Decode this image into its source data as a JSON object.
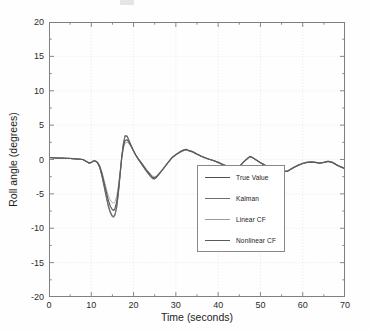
{
  "figure": {
    "type": "line-chart",
    "background": "#ffffff",
    "axes_color": "#808080"
  },
  "axis": {
    "xlabel": "Time (seconds)",
    "ylabel": "Roll angle (degrees)",
    "xticks": [
      0,
      10,
      20,
      30,
      40,
      50,
      60,
      70
    ],
    "yticks": [
      20,
      15,
      10,
      5,
      0,
      -5,
      -10,
      -15,
      -20
    ],
    "xlim": [
      0,
      70
    ],
    "ylim": [
      -20,
      20
    ]
  },
  "legend": {
    "position": "lower-right-inside",
    "entries": [
      {
        "label": "True Value",
        "color": "#4f4f4f",
        "width": 0.8
      },
      {
        "label": "Kalman",
        "color": "#6e6e6e",
        "width": 1.1
      },
      {
        "label": "Linear CF",
        "color": "#9a9a9a",
        "width": 0.8
      },
      {
        "label": "Nonlinear CF",
        "color": "#5a5a5a",
        "width": 1.2
      }
    ]
  },
  "chart_data": {
    "type": "line",
    "title": "",
    "xlabel": "Time (seconds)",
    "ylabel": "Roll angle (degrees)",
    "xlim": [
      0,
      70
    ],
    "ylim": [
      -20,
      20
    ],
    "xticks": [
      0,
      10,
      20,
      30,
      40,
      50,
      60,
      70
    ],
    "yticks": [
      20,
      15,
      10,
      5,
      0,
      -5,
      -10,
      -15,
      -20
    ],
    "grid": "dotted-major",
    "legend_position": "lower right",
    "x": [
      0,
      1,
      2,
      3,
      4,
      5,
      6,
      7,
      8,
      9,
      9.5,
      10,
      10.5,
      11,
      11.5,
      12,
      12.5,
      13,
      13.5,
      14,
      14.5,
      15,
      15.3,
      15.6,
      16,
      16.4,
      16.8,
      17.2,
      17.6,
      18,
      18.5,
      19,
      19.5,
      20,
      20.5,
      21,
      22,
      23,
      24,
      24.5,
      25,
      25.5,
      26,
      27,
      28,
      29,
      30,
      31,
      32,
      32.5,
      33,
      34,
      35,
      36,
      37,
      38,
      39,
      40,
      41,
      42,
      43,
      44,
      44.5,
      45,
      46,
      47,
      47.5,
      48,
      49,
      50,
      51,
      52,
      53,
      54,
      55,
      56,
      56.5,
      57,
      58,
      59,
      60,
      61,
      62,
      63,
      64,
      65,
      66,
      67,
      68,
      69,
      70
    ],
    "series": [
      {
        "name": "True Value",
        "color": "#4f4f4f",
        "values": [
          0.3,
          0.25,
          0.2,
          0.2,
          0.18,
          0.15,
          0.1,
          0.05,
          0.0,
          -0.35,
          -0.55,
          -0.45,
          -0.2,
          -0.25,
          -0.5,
          -1.2,
          -2.4,
          -3.9,
          -5.4,
          -6.8,
          -7.8,
          -8.35,
          -8.4,
          -8.1,
          -7.0,
          -5.0,
          -2.4,
          0.3,
          2.3,
          3.4,
          3.3,
          2.6,
          1.9,
          1.2,
          0.6,
          0.1,
          -0.8,
          -1.7,
          -2.5,
          -2.8,
          -2.85,
          -2.6,
          -2.2,
          -1.4,
          -0.6,
          0.2,
          0.7,
          1.1,
          1.4,
          1.45,
          1.3,
          1.1,
          0.75,
          0.45,
          0.2,
          0.0,
          -0.2,
          -0.45,
          -0.75,
          -1.0,
          -1.25,
          -1.45,
          -1.4,
          -1.1,
          -0.4,
          0.15,
          0.4,
          0.3,
          -0.1,
          -0.5,
          -0.85,
          -1.15,
          -1.4,
          -1.6,
          -1.7,
          -1.75,
          -1.7,
          -1.5,
          -1.15,
          -0.85,
          -0.6,
          -0.45,
          -0.4,
          -0.45,
          -0.55,
          -0.45,
          -0.3,
          -0.45,
          -0.8,
          -1.1,
          -1.35
        ]
      },
      {
        "name": "Kalman",
        "color": "#6e6e6e",
        "values": [
          0.3,
          0.25,
          0.2,
          0.2,
          0.18,
          0.15,
          0.1,
          0.05,
          0.0,
          -0.35,
          -0.55,
          -0.45,
          -0.2,
          -0.25,
          -0.5,
          -1.15,
          -2.3,
          -3.7,
          -5.2,
          -6.6,
          -7.6,
          -8.2,
          -8.3,
          -8.0,
          -6.9,
          -4.9,
          -2.3,
          0.4,
          2.4,
          3.5,
          3.4,
          2.7,
          1.95,
          1.25,
          0.65,
          0.15,
          -0.75,
          -1.65,
          -2.45,
          -2.75,
          -2.8,
          -2.55,
          -2.15,
          -1.35,
          -0.55,
          0.25,
          0.75,
          1.15,
          1.45,
          1.5,
          1.35,
          1.15,
          0.8,
          0.5,
          0.25,
          0.05,
          -0.15,
          -0.4,
          -0.7,
          -0.95,
          -1.2,
          -1.4,
          -1.35,
          -1.05,
          -0.35,
          0.2,
          0.45,
          0.35,
          -0.05,
          -0.45,
          -0.8,
          -1.1,
          -1.35,
          -1.55,
          -1.65,
          -1.7,
          -1.65,
          -1.45,
          -1.1,
          -0.8,
          -0.55,
          -0.4,
          -0.35,
          -0.4,
          -0.5,
          -0.4,
          -0.25,
          -0.4,
          -0.75,
          -1.05,
          -1.3
        ]
      },
      {
        "name": "Linear CF",
        "color": "#9a9a9a",
        "values": [
          0.28,
          0.24,
          0.2,
          0.19,
          0.17,
          0.14,
          0.1,
          0.05,
          0.0,
          -0.3,
          -0.45,
          -0.4,
          -0.2,
          -0.2,
          -0.4,
          -0.9,
          -1.8,
          -2.9,
          -4.1,
          -5.2,
          -5.9,
          -6.3,
          -6.35,
          -6.15,
          -5.4,
          -3.9,
          -1.9,
          0.2,
          1.6,
          2.4,
          2.5,
          2.2,
          1.75,
          1.2,
          0.7,
          0.25,
          -0.55,
          -1.4,
          -2.1,
          -2.4,
          -2.5,
          -2.35,
          -2.05,
          -1.35,
          -0.6,
          0.15,
          0.65,
          1.0,
          1.3,
          1.35,
          1.25,
          1.05,
          0.75,
          0.45,
          0.2,
          0.0,
          -0.2,
          -0.4,
          -0.65,
          -0.9,
          -1.15,
          -1.3,
          -1.25,
          -1.0,
          -0.35,
          0.15,
          0.4,
          0.3,
          -0.05,
          -0.45,
          -0.75,
          -1.05,
          -1.3,
          -1.5,
          -1.6,
          -1.65,
          -1.6,
          -1.4,
          -1.1,
          -0.8,
          -0.55,
          -0.4,
          -0.35,
          -0.4,
          -0.5,
          -0.4,
          -0.25,
          -0.4,
          -0.75,
          -1.05,
          -1.3
        ]
      },
      {
        "name": "Nonlinear CF",
        "color": "#5a5a5a",
        "values": [
          0.3,
          0.25,
          0.2,
          0.2,
          0.18,
          0.15,
          0.1,
          0.05,
          0.0,
          -0.32,
          -0.5,
          -0.42,
          -0.2,
          -0.22,
          -0.45,
          -1.0,
          -2.0,
          -3.3,
          -4.6,
          -5.9,
          -6.8,
          -7.3,
          -7.4,
          -7.15,
          -6.2,
          -4.4,
          -2.1,
          0.3,
          1.9,
          2.8,
          2.85,
          2.4,
          1.85,
          1.25,
          0.7,
          0.2,
          -0.65,
          -1.5,
          -2.25,
          -2.6,
          -2.65,
          -2.45,
          -2.1,
          -1.35,
          -0.55,
          0.2,
          0.7,
          1.1,
          1.38,
          1.42,
          1.3,
          1.1,
          0.78,
          0.48,
          0.22,
          0.0,
          -0.18,
          -0.42,
          -0.7,
          -0.95,
          -1.2,
          -1.4,
          -1.35,
          -1.05,
          -0.38,
          0.18,
          0.42,
          0.32,
          -0.08,
          -0.48,
          -0.82,
          -1.12,
          -1.38,
          -1.55,
          -1.68,
          -1.72,
          -1.68,
          -1.48,
          -1.12,
          -0.82,
          -0.58,
          -0.42,
          -0.38,
          -0.42,
          -0.52,
          -0.42,
          -0.28,
          -0.42,
          -0.78,
          -1.08,
          -1.32
        ]
      }
    ]
  }
}
